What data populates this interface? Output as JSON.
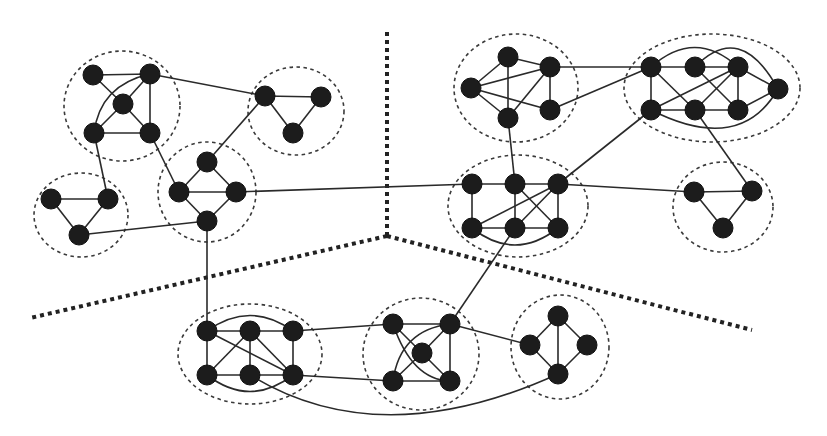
{
  "diagram": {
    "type": "partitioned-community-graph",
    "colors": {
      "node": "#1c1c1c",
      "edge": "#2a2a2a",
      "cluster_outline": "#3a3a3a",
      "partition_line": "#222222",
      "background": "#ffffff"
    },
    "node_radius": 10,
    "partitions": [
      {
        "id": "P1",
        "points": [
          [
            387,
            32
          ],
          [
            387,
            236
          ]
        ]
      },
      {
        "id": "P2",
        "points": [
          [
            387,
            236
          ],
          [
            30,
            318
          ]
        ]
      },
      {
        "id": "P3",
        "points": [
          [
            387,
            236
          ],
          [
            752,
            330
          ]
        ]
      }
    ],
    "clusters": [
      {
        "id": "A",
        "cx": 122,
        "cy": 106,
        "rx": 58,
        "ry": 55
      },
      {
        "id": "B",
        "cx": 296,
        "cy": 111,
        "rx": 48,
        "ry": 44
      },
      {
        "id": "C",
        "cx": 207,
        "cy": 192,
        "rx": 49,
        "ry": 50
      },
      {
        "id": "D",
        "cx": 81,
        "cy": 215,
        "rx": 47,
        "ry": 42
      },
      {
        "id": "E",
        "cx": 516,
        "cy": 88,
        "rx": 62,
        "ry": 54
      },
      {
        "id": "F",
        "cx": 712,
        "cy": 88,
        "rx": 88,
        "ry": 54
      },
      {
        "id": "G",
        "cx": 518,
        "cy": 206,
        "rx": 70,
        "ry": 51
      },
      {
        "id": "H",
        "cx": 723,
        "cy": 207,
        "rx": 50,
        "ry": 45
      },
      {
        "id": "I",
        "cx": 250,
        "cy": 354,
        "rx": 72,
        "ry": 50
      },
      {
        "id": "J",
        "cx": 421,
        "cy": 354,
        "rx": 58,
        "ry": 56
      },
      {
        "id": "K",
        "cx": 560,
        "cy": 347,
        "rx": 49,
        "ry": 52
      }
    ],
    "nodes": [
      {
        "id": "A1",
        "x": 93,
        "y": 75
      },
      {
        "id": "A2",
        "x": 150,
        "y": 74
      },
      {
        "id": "A3",
        "x": 123,
        "y": 104
      },
      {
        "id": "A4",
        "x": 94,
        "y": 133
      },
      {
        "id": "A5",
        "x": 150,
        "y": 133
      },
      {
        "id": "B1",
        "x": 265,
        "y": 96
      },
      {
        "id": "B2",
        "x": 321,
        "y": 97
      },
      {
        "id": "B3",
        "x": 293,
        "y": 133
      },
      {
        "id": "C1",
        "x": 207,
        "y": 162
      },
      {
        "id": "C2",
        "x": 179,
        "y": 192
      },
      {
        "id": "C3",
        "x": 236,
        "y": 192
      },
      {
        "id": "C4",
        "x": 207,
        "y": 221
      },
      {
        "id": "D1",
        "x": 51,
        "y": 199
      },
      {
        "id": "D2",
        "x": 108,
        "y": 199
      },
      {
        "id": "D3",
        "x": 79,
        "y": 235
      },
      {
        "id": "E1",
        "x": 508,
        "y": 57
      },
      {
        "id": "E2",
        "x": 550,
        "y": 67
      },
      {
        "id": "E3",
        "x": 471,
        "y": 88
      },
      {
        "id": "E4",
        "x": 508,
        "y": 118
      },
      {
        "id": "E5",
        "x": 550,
        "y": 110
      },
      {
        "id": "F1",
        "x": 651,
        "y": 67
      },
      {
        "id": "F2",
        "x": 695,
        "y": 67
      },
      {
        "id": "F3",
        "x": 738,
        "y": 67
      },
      {
        "id": "F4",
        "x": 778,
        "y": 89
      },
      {
        "id": "F5",
        "x": 651,
        "y": 110
      },
      {
        "id": "F6",
        "x": 695,
        "y": 110
      },
      {
        "id": "F7",
        "x": 738,
        "y": 110
      },
      {
        "id": "G1",
        "x": 472,
        "y": 184
      },
      {
        "id": "G2",
        "x": 515,
        "y": 184
      },
      {
        "id": "G3",
        "x": 558,
        "y": 184
      },
      {
        "id": "G4",
        "x": 472,
        "y": 228
      },
      {
        "id": "G5",
        "x": 515,
        "y": 228
      },
      {
        "id": "G6",
        "x": 558,
        "y": 228
      },
      {
        "id": "H1",
        "x": 694,
        "y": 192
      },
      {
        "id": "H2",
        "x": 752,
        "y": 191
      },
      {
        "id": "H3",
        "x": 723,
        "y": 228
      },
      {
        "id": "I1",
        "x": 207,
        "y": 331
      },
      {
        "id": "I2",
        "x": 250,
        "y": 331
      },
      {
        "id": "I3",
        "x": 293,
        "y": 331
      },
      {
        "id": "I4",
        "x": 207,
        "y": 375
      },
      {
        "id": "I5",
        "x": 250,
        "y": 375
      },
      {
        "id": "I6",
        "x": 293,
        "y": 375
      },
      {
        "id": "J1",
        "x": 393,
        "y": 324
      },
      {
        "id": "J2",
        "x": 450,
        "y": 324
      },
      {
        "id": "J3",
        "x": 422,
        "y": 353
      },
      {
        "id": "J4",
        "x": 393,
        "y": 381
      },
      {
        "id": "J5",
        "x": 450,
        "y": 381
      },
      {
        "id": "K1",
        "x": 558,
        "y": 316
      },
      {
        "id": "K2",
        "x": 530,
        "y": 345
      },
      {
        "id": "K3",
        "x": 587,
        "y": 345
      },
      {
        "id": "K4",
        "x": 558,
        "y": 374
      }
    ],
    "edges": [
      [
        "A1",
        "A2"
      ],
      [
        "A1",
        "A3"
      ],
      [
        "A2",
        "A3"
      ],
      [
        "A2",
        "A5"
      ],
      [
        "A3",
        "A4"
      ],
      [
        "A3",
        "A5"
      ],
      [
        "A4",
        "A5"
      ],
      [
        "B1",
        "B2"
      ],
      [
        "B1",
        "B3"
      ],
      [
        "B2",
        "B3"
      ],
      [
        "C1",
        "C2"
      ],
      [
        "C1",
        "C3"
      ],
      [
        "C2",
        "C3"
      ],
      [
        "C2",
        "C4"
      ],
      [
        "C3",
        "C4"
      ],
      [
        "D1",
        "D2"
      ],
      [
        "D1",
        "D3"
      ],
      [
        "D2",
        "D3"
      ],
      [
        "E1",
        "E2"
      ],
      [
        "E1",
        "E4"
      ],
      [
        "E3",
        "E1"
      ],
      [
        "E3",
        "E2"
      ],
      [
        "E3",
        "E4"
      ],
      [
        "E3",
        "E5"
      ],
      [
        "E2",
        "E4"
      ],
      [
        "E2",
        "E5"
      ],
      [
        "F1",
        "F2"
      ],
      [
        "F2",
        "F3"
      ],
      [
        "F1",
        "F5"
      ],
      [
        "F5",
        "F6"
      ],
      [
        "F6",
        "F7"
      ],
      [
        "F3",
        "F7"
      ],
      [
        "F3",
        "F4"
      ],
      [
        "F7",
        "F4"
      ],
      [
        "F1",
        "F6"
      ],
      [
        "F5",
        "F3"
      ],
      [
        "F6",
        "F3"
      ],
      [
        "F2",
        "F7"
      ],
      [
        "G1",
        "G2"
      ],
      [
        "G2",
        "G3"
      ],
      [
        "G1",
        "G4"
      ],
      [
        "G4",
        "G5"
      ],
      [
        "G5",
        "G6"
      ],
      [
        "G3",
        "G6"
      ],
      [
        "G2",
        "G5"
      ],
      [
        "G4",
        "G3"
      ],
      [
        "G5",
        "G3"
      ],
      [
        "G2",
        "G6"
      ],
      [
        "H1",
        "H2"
      ],
      [
        "H1",
        "H3"
      ],
      [
        "H2",
        "H3"
      ],
      [
        "I1",
        "I2"
      ],
      [
        "I2",
        "I3"
      ],
      [
        "I1",
        "I4"
      ],
      [
        "I4",
        "I5"
      ],
      [
        "I5",
        "I6"
      ],
      [
        "I3",
        "I6"
      ],
      [
        "I2",
        "I5"
      ],
      [
        "I1",
        "I6"
      ],
      [
        "I2",
        "I6"
      ],
      [
        "I4",
        "I2"
      ],
      [
        "J1",
        "J2"
      ],
      [
        "J2",
        "J5"
      ],
      [
        "J4",
        "J5"
      ],
      [
        "J1",
        "J3"
      ],
      [
        "J2",
        "J3"
      ],
      [
        "J3",
        "J4"
      ],
      [
        "J3",
        "J5"
      ],
      [
        "K1",
        "K2"
      ],
      [
        "K1",
        "K3"
      ],
      [
        "K1",
        "K4"
      ],
      [
        "K2",
        "K4"
      ],
      [
        "K3",
        "K4"
      ],
      [
        "A2",
        "B1"
      ],
      [
        "A4",
        "D2"
      ],
      [
        "A5",
        "C2"
      ],
      [
        "B1",
        "C1"
      ],
      [
        "D3",
        "C4"
      ],
      [
        "C3",
        "G1"
      ],
      [
        "C4",
        "I1"
      ],
      [
        "E2",
        "F1"
      ],
      [
        "E5",
        "F1"
      ],
      [
        "E4",
        "G2"
      ],
      [
        "F5",
        "G3"
      ],
      [
        "F6",
        "H2"
      ],
      [
        "G3",
        "H1"
      ],
      [
        "G5",
        "J2"
      ],
      [
        "I3",
        "J1"
      ],
      [
        "I6",
        "J4"
      ],
      [
        "J2",
        "K2"
      ]
    ],
    "curved_edges": [
      {
        "from": "A4",
        "to": "A2",
        "ctrl": [
          100,
          85
        ]
      },
      {
        "from": "F1",
        "to": "F3",
        "ctrl": [
          695,
          28
        ]
      },
      {
        "from": "F2",
        "to": "F4",
        "ctrl": [
          740,
          20
        ]
      },
      {
        "from": "F5",
        "to": "F4",
        "ctrl": [
          740,
          155
        ]
      },
      {
        "from": "G4",
        "to": "G6",
        "ctrl": [
          515,
          262
        ]
      },
      {
        "from": "I1",
        "to": "I3",
        "ctrl": [
          250,
          300
        ]
      },
      {
        "from": "I4",
        "to": "I6",
        "ctrl": [
          250,
          408
        ]
      },
      {
        "from": "J1",
        "to": "J5",
        "ctrl": [
          412,
          380
        ]
      },
      {
        "from": "J4",
        "to": "J2",
        "ctrl": [
          400,
          330
        ]
      },
      {
        "from": "I5",
        "to": "K4",
        "ctrl": [
          380,
          455
        ]
      }
    ]
  }
}
